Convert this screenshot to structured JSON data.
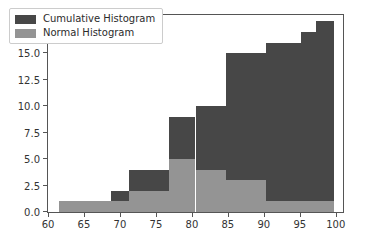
{
  "chart_data": {
    "type": "bar",
    "title": "",
    "xlabel": "",
    "ylabel": "",
    "xlim": [
      60,
      101
    ],
    "ylim": [
      0,
      18.6
    ],
    "grid": false,
    "legend_position": "upper left",
    "xticks": [
      60,
      65,
      70,
      75,
      80,
      85,
      90,
      95,
      100
    ],
    "yticks": [
      0.0,
      2.5,
      5.0,
      7.5,
      10.0,
      12.5,
      15.0,
      17.5
    ],
    "xtick_labels": [
      "60",
      "65",
      "70",
      "75",
      "80",
      "85",
      "90",
      "95",
      "100"
    ],
    "ytick_labels": [
      "0.0",
      "2.5",
      "5.0",
      "7.5",
      "10.0",
      "12.5",
      "15.0",
      "17.5"
    ],
    "bin_edges": [
      61.5,
      68.8,
      71.2,
      76.8,
      80.5,
      84.8,
      90.3,
      95.2,
      97.2,
      99.7
    ],
    "series": [
      {
        "name": "Cumulative Histogram",
        "color": "#474747",
        "values": [
          1,
          2,
          4,
          9,
          10,
          15,
          16,
          17,
          18
        ]
      },
      {
        "name": "Normal Histogram",
        "color": "#949494",
        "values": [
          1,
          1,
          2,
          5,
          4,
          3,
          1,
          1,
          1
        ]
      }
    ]
  },
  "legend": {
    "items": [
      {
        "label": "Cumulative Histogram",
        "color": "#474747"
      },
      {
        "label": "Normal Histogram",
        "color": "#949494"
      }
    ]
  }
}
